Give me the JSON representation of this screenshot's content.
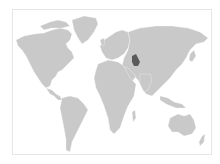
{
  "map": {
    "type": "world-locator-map",
    "projection": "equirectangular-like",
    "highlighted_country": "Turkmenistan",
    "colors": {
      "background": "#ffffff",
      "land": "#c9c9c9",
      "highlight": "#5a5a5a",
      "frame": "#e6e6e6"
    }
  }
}
